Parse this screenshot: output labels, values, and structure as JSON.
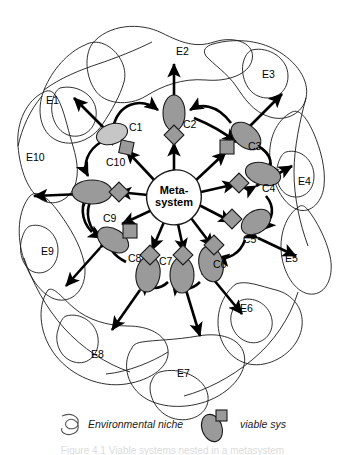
{
  "figure": {
    "center": {
      "line1": "Meta-",
      "line2": "system",
      "name": "Meta-system"
    }
  },
  "viable_systems": [
    {
      "id": "C1",
      "label": "C1",
      "shade": "light",
      "attachment": "square",
      "label_x": 129,
      "label_y": 131
    },
    {
      "id": "C2",
      "label": "C2",
      "shade": "mid",
      "attachment": "diamond",
      "label_x": 183,
      "label_y": 128
    },
    {
      "id": "C3",
      "label": "C3",
      "shade": "mid",
      "attachment": "square",
      "label_x": 248,
      "label_y": 150
    },
    {
      "id": "C4",
      "label": "C4",
      "shade": "mid",
      "attachment": "diamond",
      "label_x": 262,
      "label_y": 192
    },
    {
      "id": "C5",
      "label": "C5",
      "shade": "mid",
      "attachment": "square",
      "label_x": 243,
      "label_y": 243
    },
    {
      "id": "C6",
      "label": "C6",
      "shade": "mid",
      "attachment": "square",
      "label_x": 213,
      "label_y": 268
    },
    {
      "id": "C7",
      "label": "C7",
      "shade": "mid",
      "attachment": "diamond",
      "label_x": 159,
      "label_y": 265
    },
    {
      "id": "C8",
      "label": "C8",
      "shade": "mid",
      "attachment": "diamond",
      "label_x": 128,
      "label_y": 262
    },
    {
      "id": "C9",
      "label": "C9",
      "shade": "mid",
      "attachment": "square",
      "label_x": 103,
      "label_y": 222
    },
    {
      "id": "C10",
      "label": "C10",
      "shade": "mid",
      "attachment": "diamond",
      "label_x": 106,
      "label_y": 166
    }
  ],
  "environments": [
    {
      "id": "E1",
      "label": "E1",
      "label_x": 46,
      "label_y": 104
    },
    {
      "id": "E2",
      "label": "E2",
      "label_x": 176,
      "label_y": 55
    },
    {
      "id": "E3",
      "label": "E3",
      "label_x": 262,
      "label_y": 78
    },
    {
      "id": "E4",
      "label": "E4",
      "label_x": 298,
      "label_y": 185
    },
    {
      "id": "E5",
      "label": "E5",
      "label_x": 285,
      "label_y": 262
    },
    {
      "id": "E6",
      "label": "E6",
      "label_x": 240,
      "label_y": 312
    },
    {
      "id": "E7",
      "label": "E7",
      "label_x": 177,
      "label_y": 377
    },
    {
      "id": "E8",
      "label": "E8",
      "label_x": 91,
      "label_y": 358
    },
    {
      "id": "E9",
      "label": "E9",
      "label_x": 41,
      "label_y": 255
    },
    {
      "id": "E10",
      "label": "E10",
      "label_x": 26,
      "label_y": 161
    }
  ],
  "legend": [
    {
      "key": "environmental-niche",
      "label": "Environmental niche",
      "icon": "niche-curve-icon"
    },
    {
      "key": "viable-system",
      "label": "viable sys",
      "icon": "viable-system-icon"
    }
  ],
  "caption": {
    "text": "Figure 4.1 Viable systems nested in a metasystem"
  },
  "colors": {
    "stroke": "#1a1a1a",
    "viable_fill": "#9a9a9a",
    "viable_fill_light": "#c6c6c6",
    "background": "#ffffff",
    "arrow": "#000000"
  }
}
